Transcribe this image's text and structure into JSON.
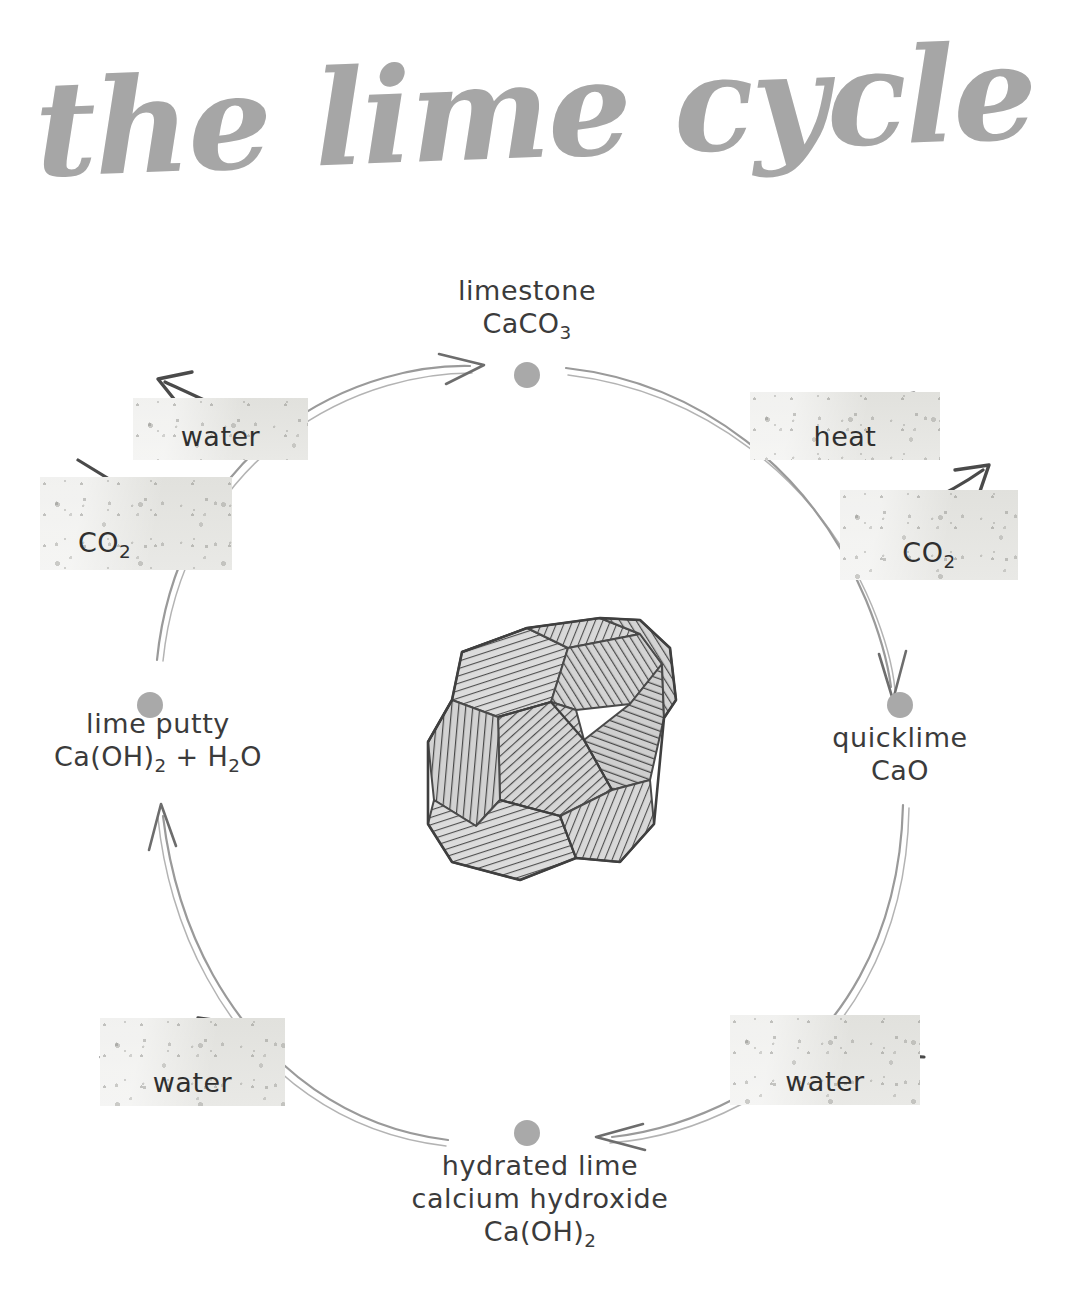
{
  "title": "the lime cycle",
  "colors": {
    "node_dot": "#a9a9a9",
    "arc_stroke": "#9a9a9a",
    "label_arrow": "#4a4a4a",
    "text": "#3b3b3b",
    "chip_texture": "#e6e6e3",
    "background": "#ffffff"
  },
  "nodes": [
    {
      "id": "limestone",
      "name": "limestone",
      "formula": "CaCO3",
      "formula_html": "CaCO<sub>3</sub>",
      "position": "top",
      "dot": {
        "x": 527,
        "y": 375
      }
    },
    {
      "id": "quicklime",
      "name": "quicklime",
      "formula": "CaO",
      "formula_html": "CaO",
      "position": "right",
      "dot": {
        "x": 900,
        "y": 705
      }
    },
    {
      "id": "hydrated-lime",
      "name": "hydrated lime",
      "subtitle": "calcium hydroxide",
      "formula": "Ca(OH)2",
      "formula_html": "Ca(OH)<sub>2</sub>",
      "position": "bottom",
      "dot": {
        "x": 527,
        "y": 1133
      }
    },
    {
      "id": "lime-putty",
      "name": "lime putty",
      "formula": "Ca(OH)2 + H2O",
      "formula_html": "Ca(OH)<sub>2</sub> + H<sub>2</sub>O",
      "position": "left",
      "dot": {
        "x": 150,
        "y": 705
      }
    }
  ],
  "edges": [
    {
      "id": "limestone-to-quicklime",
      "from": "limestone",
      "to": "quicklime",
      "side": "top-right"
    },
    {
      "id": "quicklime-to-hydrated",
      "from": "quicklime",
      "to": "hydrated-lime",
      "side": "bottom-right"
    },
    {
      "id": "hydrated-to-limeputty",
      "from": "hydrated-lime",
      "to": "lime-putty",
      "side": "bottom-left"
    },
    {
      "id": "limeputty-to-limestone",
      "from": "lime-putty",
      "to": "limestone",
      "side": "top-left"
    }
  ],
  "edge_labels": [
    {
      "id": "heat",
      "text": "heat",
      "text_html": "heat",
      "direction": "input",
      "edge": "limestone-to-quicklime",
      "position": "top-right"
    },
    {
      "id": "co2-right",
      "text": "CO2",
      "text_html": "CO<sub>2</sub>",
      "direction": "output",
      "edge": "limestone-to-quicklime",
      "position": "right-upper"
    },
    {
      "id": "water-bottom-right",
      "text": "water",
      "text_html": "water",
      "direction": "input",
      "edge": "quicklime-to-hydrated",
      "position": "bottom-right"
    },
    {
      "id": "water-bottom-left",
      "text": "water",
      "text_html": "water",
      "direction": "input",
      "edge": "hydrated-to-limeputty",
      "position": "bottom-left"
    },
    {
      "id": "co2-left",
      "text": "CO2",
      "text_html": "CO<sub>2</sub>",
      "direction": "input",
      "edge": "limeputty-to-limestone",
      "position": "left-lower"
    },
    {
      "id": "water-top-left",
      "text": "water",
      "text_html": "water",
      "direction": "output",
      "edge": "limeputty-to-limestone",
      "position": "top-left"
    }
  ],
  "illustration": {
    "name": "limestone-rock",
    "description": "hand-drawn hatched limestone rock",
    "center": {
      "x": 527,
      "y": 750
    }
  }
}
